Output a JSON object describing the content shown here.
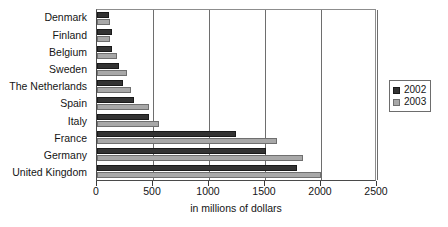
{
  "chart_data": {
    "type": "bar",
    "orientation": "horizontal",
    "title": "",
    "xlabel": "in millions of dollars",
    "ylabel": "",
    "xlim": [
      0,
      2500
    ],
    "xticks": [
      0,
      500,
      1000,
      1500,
      2000,
      2500
    ],
    "xtick_labels": [
      "0",
      "500",
      "1000",
      "1500",
      "2000",
      "2500"
    ],
    "grid": true,
    "grid_axis": "x",
    "legend_position": "right",
    "categories": [
      "Denmark",
      "Finland",
      "Belgium",
      "Sweden",
      "The Netherlands",
      "Spain",
      "Italy",
      "France",
      "Germany",
      "United Kingdom"
    ],
    "series": [
      {
        "name": "2002",
        "color": "#333333",
        "values": [
          110,
          130,
          130,
          200,
          235,
          330,
          465,
          1245,
          1510,
          1790
        ]
      },
      {
        "name": "2003",
        "color": "#a8a8a8",
        "values": [
          120,
          120,
          175,
          270,
          300,
          465,
          555,
          1610,
          1840,
          2000
        ]
      }
    ]
  },
  "legend": {
    "items": [
      {
        "label": "2002",
        "swatch": "dark-square-swatch"
      },
      {
        "label": "2003",
        "swatch": "light-square-swatch"
      }
    ]
  }
}
